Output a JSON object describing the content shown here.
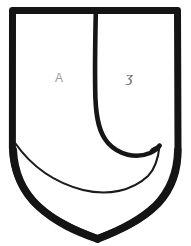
{
  "figure": {
    "kind": "heraldic-shield-line-drawing",
    "background_color": "#ffffff",
    "ink_color": "#1a1a1a",
    "canvas": {
      "width": 191,
      "height": 246
    }
  },
  "shield": {
    "name": "escutcheon-outline",
    "description": "Flat-topped shield with straight parallel sides curving to a rounded point at base",
    "stroke_color": "#141414",
    "stroke_width": 7,
    "fill_color": "#ffffff",
    "geometry": {
      "top_y": 10,
      "left_x": 12,
      "right_x": 178,
      "point_x": 97,
      "point_y": 238,
      "shoulder_y": 150
    }
  },
  "charge": {
    "name": "hook-charge",
    "description": "Vertical line descending from chief, curving left-down then sweeping right into an upturned hook",
    "stroke_color": "#161616",
    "outer_stroke_width": 4.5,
    "inner_stroke_width": 2.0,
    "start_x": 96,
    "start_y": 12,
    "hook_tip_x": 159,
    "hook_tip_y": 145
  },
  "annotations": {
    "left_field": {
      "name": "letter-a-mark",
      "text": "A",
      "x": 55,
      "y": 72,
      "color": "#9a9a9d"
    },
    "right_field": {
      "name": "letter-y-mark",
      "text": "ʒ",
      "x": 126,
      "y": 70,
      "color": "#5d5d61"
    }
  }
}
